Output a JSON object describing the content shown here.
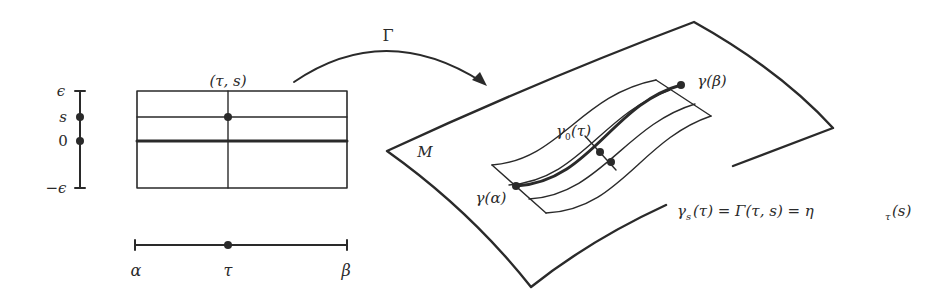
{
  "diagram": {
    "map_label": "Γ",
    "parameter_domain": {
      "s_axis": {
        "labels": {
          "top": "ϵ",
          "s": "s",
          "zero": "0",
          "bottom": "−ϵ"
        }
      },
      "rectangle": {
        "point_label": "(τ, s)"
      },
      "tau_axis": {
        "labels": {
          "left": "α",
          "middle": "τ",
          "right": "β"
        }
      }
    },
    "manifold": {
      "label": "M",
      "curve_start_label": "γ(α)",
      "curve_end_label": "γ(β)",
      "base_curve_label_main": "γ",
      "base_curve_label_sub": "0",
      "base_curve_label_arg": "(τ)",
      "formula": {
        "lhs_main": "γ",
        "lhs_sub": "s",
        "lhs_arg": "(τ) = Γ(τ, s) = η",
        "rhs_sub": "τ",
        "rhs_arg": "(s)"
      }
    },
    "colors": {
      "stroke": "#2a2a2a",
      "background": "#ffffff"
    }
  }
}
